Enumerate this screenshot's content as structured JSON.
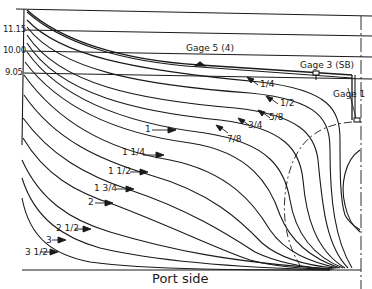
{
  "diagram": {
    "title": "Port side",
    "waterlines": [
      {
        "label": "11.15",
        "y": 29
      },
      {
        "label": "10.00",
        "y": 51
      },
      {
        "label": "9.05",
        "y": 72
      }
    ],
    "gages": [
      {
        "label": "Gage 5 (4)"
      },
      {
        "label": "Gage 3 (SB)"
      },
      {
        "label": "Gage 1"
      }
    ],
    "station_labels": [
      "1/4",
      "1/2",
      "5/8",
      "3/4",
      "7/8",
      "1",
      "1 1/4",
      "1 1/2",
      "1 3/4",
      "2",
      "2 1/2",
      "3",
      "3 1/2"
    ],
    "colors": {
      "line": "#1a1a1a",
      "background": "#ffffff"
    }
  }
}
